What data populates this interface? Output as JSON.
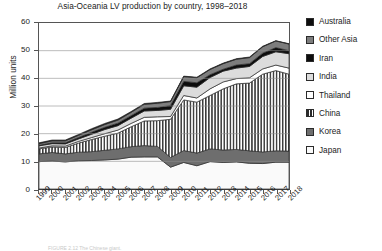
{
  "chart": {
    "title": "Asia-Oceania LV production by country, 1998–2018",
    "ylabel": "Million units",
    "xlabel": "",
    "caption": "FIGURE 2.12  The Chinese giant."
  },
  "legend": {
    "position": "right",
    "items": [
      {
        "label": "Australia",
        "color": "#0d0d0d",
        "pattern": "solid"
      },
      {
        "label": "Other Asia",
        "color": "#7d7d7d",
        "pattern": "solid"
      },
      {
        "label": "Iran",
        "color": "#0d0d0d",
        "pattern": "solid"
      },
      {
        "label": "India",
        "color": "#dcdcdc",
        "pattern": "solid"
      },
      {
        "label": "Thailand",
        "color": "#ffffff",
        "pattern": "solid"
      },
      {
        "label": "China",
        "color": "#ffffff",
        "pattern": "vertical-stripes"
      },
      {
        "label": "Korea",
        "color": "#6e6e6e",
        "pattern": "solid"
      },
      {
        "label": "Japan",
        "color": "#fafafa",
        "pattern": "solid"
      }
    ]
  },
  "chart_data": {
    "type": "area",
    "stacked": true,
    "title": "Asia-Oceania LV production by country, 1998–2018",
    "xlabel": "",
    "ylabel": "Million units",
    "ylim": [
      0,
      60
    ],
    "yticks": [
      0,
      10,
      20,
      30,
      40,
      50,
      60
    ],
    "grid": true,
    "x": [
      1999,
      2000,
      2001,
      2002,
      2003,
      2004,
      2005,
      2006,
      2007,
      2008,
      2009,
      2010,
      2011,
      2012,
      2013,
      2014,
      2015,
      2016,
      2017,
      2018
    ],
    "series": [
      {
        "name": "Japan",
        "values": [
          9.9,
          10.1,
          9.8,
          10.2,
          10.3,
          10.5,
          10.8,
          11.5,
          11.6,
          11.6,
          7.9,
          9.6,
          8.4,
          9.9,
          9.6,
          9.8,
          9.3,
          9.2,
          9.7,
          9.7
        ]
      },
      {
        "name": "Korea",
        "values": [
          2.8,
          3.1,
          2.9,
          3.1,
          3.2,
          3.5,
          3.7,
          3.8,
          4.1,
          3.8,
          3.5,
          4.3,
          4.6,
          4.6,
          4.5,
          4.5,
          4.5,
          4.2,
          4.1,
          4.0
        ]
      },
      {
        "name": "China",
        "values": [
          1.8,
          2.0,
          2.3,
          3.3,
          4.4,
          5.1,
          5.7,
          7.2,
          8.9,
          9.3,
          13.8,
          18.3,
          18.4,
          19.3,
          22.1,
          23.7,
          24.5,
          28.1,
          29.0,
          27.8
        ]
      },
      {
        "name": "Thailand",
        "values": [
          0.3,
          0.4,
          0.5,
          0.6,
          0.7,
          0.9,
          1.1,
          1.2,
          1.3,
          1.4,
          1.0,
          1.6,
          1.5,
          2.4,
          2.5,
          1.9,
          1.9,
          1.9,
          2.0,
          2.2
        ]
      },
      {
        "name": "India",
        "values": [
          0.8,
          0.8,
          0.8,
          0.9,
          1.2,
          1.5,
          1.6,
          1.9,
          2.3,
          2.3,
          2.6,
          3.5,
          3.9,
          4.1,
          3.9,
          3.8,
          4.1,
          4.5,
          4.8,
          5.2
        ]
      },
      {
        "name": "Iran",
        "values": [
          0.2,
          0.3,
          0.4,
          0.5,
          0.7,
          0.8,
          0.9,
          0.9,
          1.0,
          1.1,
          1.4,
          1.6,
          1.6,
          1.0,
          0.7,
          1.1,
          1.0,
          1.2,
          1.5,
          1.1
        ]
      },
      {
        "name": "Other Asia",
        "values": [
          0.6,
          0.7,
          0.7,
          0.8,
          0.9,
          1.0,
          1.1,
          1.2,
          1.4,
          1.5,
          1.4,
          1.7,
          1.8,
          1.9,
          2.0,
          2.1,
          2.2,
          2.3,
          2.4,
          2.4
        ]
      },
      {
        "name": "Australia",
        "values": [
          0.3,
          0.3,
          0.3,
          0.3,
          0.4,
          0.4,
          0.4,
          0.3,
          0.3,
          0.3,
          0.2,
          0.2,
          0.2,
          0.2,
          0.2,
          0.2,
          0.2,
          0.2,
          0.1,
          0.1
        ]
      }
    ],
    "totals": [
      16.7,
      17.7,
      17.7,
      19.7,
      21.8,
      23.7,
      25.3,
      28.0,
      30.9,
      31.3,
      31.8,
      40.8,
      40.4,
      43.4,
      45.5,
      47.1,
      47.7,
      51.6,
      53.6,
      52.5
    ]
  },
  "axes": {
    "ytick_labels": [
      "60",
      "50",
      "40",
      "30",
      "20",
      "10",
      "0"
    ],
    "xtick_labels": [
      "1999",
      "2000",
      "2001",
      "2002",
      "2003",
      "2004",
      "2005",
      "2006",
      "2007",
      "2008",
      "2009",
      "2010",
      "2011",
      "2012",
      "2013",
      "2014",
      "2015",
      "2016",
      "2017",
      "2018"
    ]
  }
}
